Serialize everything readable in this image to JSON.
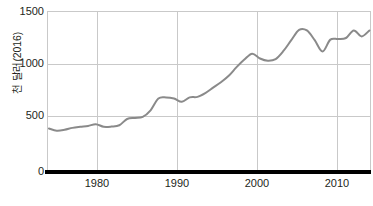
{
  "chart_data": {
    "type": "line",
    "title": "",
    "subtitle": "",
    "xlabel": "",
    "ylabel": "천 달러(2016)",
    "xlim": [
      1973.75,
      2015.2
    ],
    "ylim": [
      0,
      1500
    ],
    "grid": true,
    "legend": "none",
    "y_ticks": [
      0,
      500,
      1000,
      1500
    ],
    "y_tick_labels": [
      "0",
      "500",
      "1000",
      "1500"
    ],
    "x_ticks": [
      1980,
      1990,
      2000,
      2010
    ],
    "x_tick_labels": [
      "1980",
      "1990",
      "2000",
      "2010"
    ],
    "series": [
      {
        "name": "천 달러(2016)",
        "color": "#8a8a8a",
        "x": [
          1974,
          1975,
          1976,
          1977,
          1978,
          1979,
          1980,
          1981,
          1982,
          1983,
          1984,
          1985,
          1986,
          1987,
          1988,
          1989,
          1990,
          1991,
          1992,
          1993,
          1994,
          1995,
          1996,
          1997,
          1998,
          1999,
          2000,
          2001,
          2002,
          2003,
          2004,
          2005,
          2006,
          2007,
          2008,
          2009,
          2010,
          2011,
          2012,
          2013,
          2014,
          2015
        ],
        "values": [
          412,
          392,
          400,
          418,
          428,
          436,
          452,
          428,
          430,
          442,
          500,
          510,
          520,
          580,
          690,
          700,
          690,
          660,
          700,
          705,
          740,
          790,
          840,
          900,
          980,
          1050,
          1105,
          1060,
          1040,
          1055,
          1130,
          1230,
          1325,
          1320,
          1230,
          1125,
          1235,
          1240,
          1250,
          1320,
          1265,
          1320
        ]
      }
    ]
  },
  "y_axis": {
    "labels": [
      "1500",
      "1000",
      "500",
      "0"
    ],
    "title": "천 달러(2016)"
  },
  "x_axis": {
    "labels": [
      "1980",
      "1990",
      "2000",
      "2010"
    ]
  },
  "colors": {
    "line": "#8a8a8a",
    "grid": "#c9c9c9",
    "axis": "#000000",
    "text": "#231f20",
    "background": "#ffffff"
  }
}
